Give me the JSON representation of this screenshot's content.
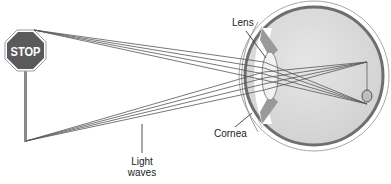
{
  "diagram": {
    "object": {
      "type": "stop-sign",
      "text": "STOP",
      "fill_color": "#5a5a5a",
      "text_color": "#ffffff"
    },
    "labels": {
      "lens": "Lens",
      "cornea": "Cornea",
      "light_waves_line1": "Light",
      "light_waves_line2": "waves"
    },
    "colors": {
      "ray": "#555555",
      "eye_fill": "#d9d9d9",
      "sclera_outline": "#6e6e6e",
      "outer_outline": "#9a9a9a",
      "leader_line": "#222222"
    }
  }
}
